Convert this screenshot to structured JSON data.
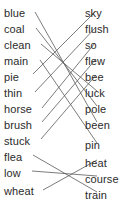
{
  "worksheet": {
    "type": "word-matching-exercise",
    "left_column": {
      "name": "left-word-list",
      "words": [
        {
          "label": "blue",
          "y": 8
        },
        {
          "label": "coal",
          "y": 24
        },
        {
          "label": "clean",
          "y": 40
        },
        {
          "label": "main",
          "y": 56
        },
        {
          "label": "pie",
          "y": 72
        },
        {
          "label": "thin",
          "y": 88
        },
        {
          "label": "horse",
          "y": 104
        },
        {
          "label": "brush",
          "y": 120
        },
        {
          "label": "stuck",
          "y": 136
        },
        {
          "label": "flea",
          "y": 152
        },
        {
          "label": "low",
          "y": 168
        },
        {
          "label": "wheat",
          "y": 186
        }
      ]
    },
    "right_column": {
      "name": "right-word-list",
      "words": [
        {
          "label": "sky",
          "y": 8
        },
        {
          "label": "flush",
          "y": 24
        },
        {
          "label": "so",
          "y": 40
        },
        {
          "label": "flew",
          "y": 56
        },
        {
          "label": "bee",
          "y": 72
        },
        {
          "label": "luck",
          "y": 88
        },
        {
          "label": "pole",
          "y": 104
        },
        {
          "label": "been",
          "y": 120
        },
        {
          "label": "pin",
          "y": 140
        },
        {
          "label": "heat",
          "y": 158
        },
        {
          "label": "course",
          "y": 174
        },
        {
          "label": "train",
          "y": 190
        }
      ]
    },
    "connections": [
      {
        "from": "blue",
        "to": "been",
        "x1": 35,
        "y1": 12,
        "x2": 97,
        "y2": 122
      },
      {
        "from": "coal",
        "to": "pole",
        "x1": 36,
        "y1": 28,
        "x2": 97,
        "y2": 106
      },
      {
        "from": "clean",
        "to": "luck",
        "x1": 41,
        "y1": 44,
        "x2": 97,
        "y2": 91
      },
      {
        "from": "main",
        "to": "pin",
        "x1": 40,
        "y1": 60,
        "x2": 97,
        "y2": 143
      },
      {
        "from": "pie",
        "to": "sky",
        "x1": 33,
        "y1": 74,
        "x2": 96,
        "y2": 11
      },
      {
        "from": "thin",
        "to": "flush",
        "x1": 35,
        "y1": 92,
        "x2": 96,
        "y2": 27
      },
      {
        "from": "horse",
        "to": "so",
        "x1": 42,
        "y1": 108,
        "x2": 95,
        "y2": 43
      },
      {
        "from": "brush",
        "to": "flew",
        "x1": 42,
        "y1": 122,
        "x2": 96,
        "y2": 59
      },
      {
        "from": "stuck",
        "to": "bee",
        "x1": 41,
        "y1": 139,
        "x2": 96,
        "y2": 75
      },
      {
        "from": "flea",
        "to": "train",
        "x1": 33,
        "y1": 155,
        "x2": 97,
        "y2": 192
      },
      {
        "from": "low",
        "to": "course",
        "x1": 32,
        "y1": 171,
        "x2": 97,
        "y2": 176
      },
      {
        "from": "wheat",
        "to": "heat",
        "x1": 43,
        "y1": 190,
        "x2": 97,
        "y2": 160
      }
    ],
    "style": {
      "line_color": "#5a5a5a",
      "text_color": "#2b2b2b",
      "background": "#ffffff"
    }
  }
}
